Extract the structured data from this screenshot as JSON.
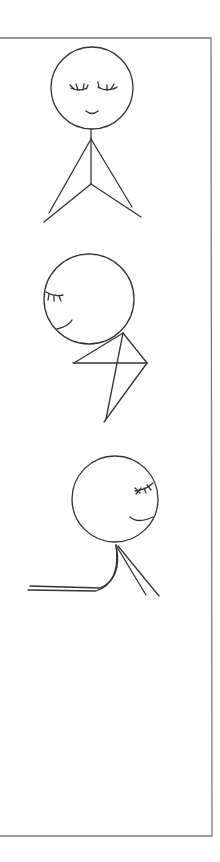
{
  "diagram": {
    "title": "",
    "stroke_color": "#333333",
    "frame_color": "#7a7a7a",
    "background": "#ffffff",
    "frame": {
      "x": 0,
      "y": 38,
      "right": 212,
      "bottom": 836
    },
    "figures": [
      {
        "id": "figure-standing-hands-together",
        "pose": "upright, eyes closed, smiling, hands joined in front",
        "head": {
          "cx": 92,
          "cy": 88,
          "r": 41
        }
      },
      {
        "id": "figure-bowing-head",
        "pose": "head tilted forward, eyes closed, arms folded",
        "head": {
          "cx": 89,
          "cy": 299,
          "r": 45
        }
      },
      {
        "id": "figure-reaching-forward",
        "pose": "head tilted back, eyes closed, one arm extended to the side",
        "head": {
          "cx": 115,
          "cy": 499,
          "r": 43
        }
      }
    ]
  }
}
